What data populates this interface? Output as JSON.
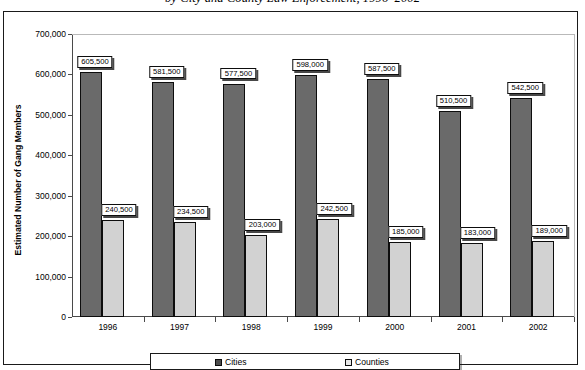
{
  "chart_data": {
    "type": "bar",
    "title": "by City and County Law Enforcement, 1996–2002",
    "xlabel": "",
    "ylabel": "Estimated Number of Gang Members",
    "ylim": [
      0,
      700000
    ],
    "ytick_labels": [
      "700,000",
      "600,000",
      "500,000",
      "400,000",
      "300,000",
      "200,000",
      "100,000",
      "0"
    ],
    "ytick_values": [
      700000,
      600000,
      500000,
      400000,
      300000,
      200000,
      100000,
      0
    ],
    "grid": true,
    "legend_position": "bottom",
    "categories": [
      "1996",
      "1997",
      "1998",
      "1999",
      "2000",
      "2001",
      "2002"
    ],
    "series": [
      {
        "name": "Cities",
        "color": "#6a6a6a",
        "values": [
          605500,
          581500,
          577500,
          598000,
          587500,
          510500,
          542500
        ],
        "labels": [
          "605,500",
          "581,500",
          "577,500",
          "598,000",
          "587,500",
          "510,500",
          "542,500"
        ]
      },
      {
        "name": "Counties",
        "color": "#d2d2d2",
        "values": [
          240500,
          234500,
          203000,
          242500,
          185000,
          183000,
          189000
        ],
        "labels": [
          "240,500",
          "234,500",
          "203,000",
          "242,500",
          "185,000",
          "183,000",
          "189,000"
        ]
      }
    ]
  },
  "legend": {
    "items": [
      {
        "label": "Cities"
      },
      {
        "label": "Counties"
      }
    ]
  }
}
